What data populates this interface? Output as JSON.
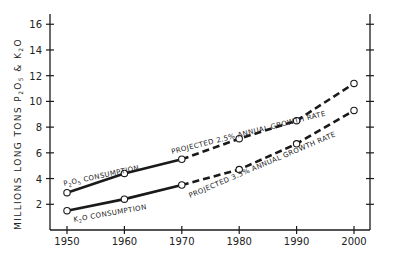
{
  "chart_data": {
    "type": "line",
    "title": "",
    "xlabel": "",
    "ylabel": "MILLIONS LONG TONS P2O5 & K2O",
    "ylabel_parts": {
      "main": "MILLIONS  LONG  TONS  ",
      "p": "P",
      "p_sub": "2",
      "o": "O",
      "o_sub": "5",
      "amp": " & ",
      "k": "K",
      "k_sub": "2",
      "o2": "O"
    },
    "x": [
      1950,
      1960,
      1970,
      1980,
      1990,
      2000
    ],
    "xticks": [
      "1950",
      "1960",
      "1970",
      "1980",
      "1990",
      "2000"
    ],
    "yticks": [
      "2",
      "4",
      "6",
      "8",
      "10",
      "12",
      "14",
      "16"
    ],
    "ylim": [
      0,
      16
    ],
    "xlim": [
      1947,
      2003
    ],
    "grid": false,
    "legend": "none (inline annotations)",
    "series": [
      {
        "name": "P2O5 consumption",
        "values": [
          2.9,
          4.4,
          5.5,
          7.1,
          8.5,
          11.4
        ],
        "actual_through": 1970,
        "style_actual": "solid",
        "style_projected": "dashed"
      },
      {
        "name": "K2O consumption",
        "values": [
          1.5,
          2.4,
          3.5,
          4.7,
          6.7,
          9.3
        ],
        "actual_through": 1970,
        "style_actual": "solid",
        "style_projected": "dashed"
      }
    ],
    "annotations": {
      "p2o5_consumption": {
        "pre": "P",
        "sub1": "2",
        "mid": "O",
        "sub2": "5",
        "post": " CONSUMPTION"
      },
      "k2o_consumption": {
        "pre": "K",
        "sub1": "2",
        "post": "O  CONSUMPTION"
      },
      "p2o5_projection": "PROJECTED 2.5% ANNUAL GROWTH RATE",
      "k2o_projection": "PROJECTED 3.5% ANNUAL GROWTH RATE"
    }
  },
  "colors": {
    "ink": "#1a1a1a",
    "background": "#ffffff"
  }
}
